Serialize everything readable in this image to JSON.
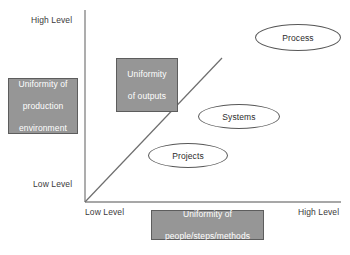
{
  "diagram": {
    "colors": {
      "box_fill": "#969696",
      "box_border": "#5d5d5d",
      "box_text": "#ffffff",
      "ellipse_fill": "#ffffff",
      "ellipse_border": "#585858",
      "axis": "#8a8a8a",
      "diagonal": "#6e6e6e",
      "label_text": "#3a3a3a"
    },
    "axes": {
      "y": {
        "name": "vertical-axis",
        "axis_title": "Uniformity of production environment",
        "high_label": "High Level",
        "low_label": "Low Level"
      },
      "x": {
        "name": "horizontal-axis",
        "axis_title": "Uniformity of people/steps/methods",
        "low_label": "Low Level",
        "high_label": "High Level"
      }
    },
    "axis_title_boxes": [
      {
        "id": "box-production",
        "name": "y-axis-title-box",
        "lines": [
          "Uniformity of",
          "production",
          "environment"
        ],
        "text": "Uniformity of production environment"
      },
      {
        "id": "box-outputs",
        "name": "uniformity-of-outputs-box",
        "lines": [
          "Uniformity",
          "of outputs"
        ],
        "text": "Uniformity of outputs"
      },
      {
        "id": "box-people",
        "name": "x-axis-title-box",
        "lines": [
          "Uniformity of",
          "people/steps/methods"
        ],
        "text": "Uniformity of people/steps/methods"
      }
    ],
    "nodes": [
      {
        "id": "ellipse-process",
        "name": "process-ellipse",
        "label": "Process"
      },
      {
        "id": "ellipse-systems",
        "name": "systems-ellipse",
        "label": "Systems"
      },
      {
        "id": "ellipse-projects",
        "name": "projects-ellipse",
        "label": "Projects"
      }
    ],
    "diagonal_line": {
      "name": "diagonal-reference-line",
      "description": "45-degree reference line from origin",
      "from": [
        85,
        202
      ],
      "to": [
        222,
        58
      ]
    }
  }
}
